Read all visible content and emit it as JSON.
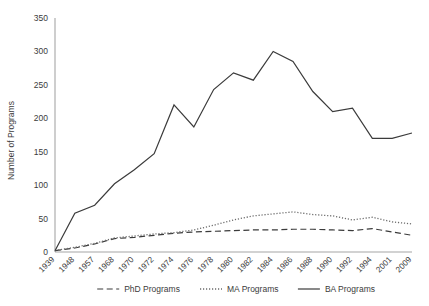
{
  "chart_data": {
    "type": "line",
    "title": "",
    "xlabel": "",
    "ylabel": "Number of Programs",
    "ylim": [
      0,
      350
    ],
    "ytick_step": 50,
    "yticks": [
      "0",
      "50",
      "100",
      "150",
      "200",
      "250",
      "300",
      "350"
    ],
    "grid": false,
    "legend_position": "bottom",
    "categories": [
      "1939",
      "1948",
      "1957",
      "1968",
      "1970",
      "1972",
      "1974",
      "1976",
      "1978",
      "1980",
      "1982",
      "1984",
      "1986",
      "1988",
      "1990",
      "1992",
      "1994",
      "2001",
      "2009"
    ],
    "series": [
      {
        "name": "PhD Programs",
        "style": "dashed",
        "color": "#3b3b3b",
        "values": [
          2,
          6,
          12,
          20,
          22,
          25,
          28,
          30,
          31,
          32,
          33,
          33,
          34,
          34,
          33,
          32,
          35,
          30,
          25
        ]
      },
      {
        "name": "MA Programs",
        "style": "dotted",
        "color": "#6b6b6b",
        "values": [
          2,
          7,
          13,
          21,
          24,
          27,
          29,
          33,
          40,
          48,
          54,
          57,
          60,
          56,
          54,
          48,
          52,
          45,
          42
        ]
      },
      {
        "name": "BA Programs",
        "style": "solid",
        "color": "#3b3b3b",
        "values": [
          2,
          58,
          70,
          102,
          123,
          147,
          220,
          187,
          243,
          268,
          257,
          300,
          285,
          240,
          210,
          215,
          170,
          170,
          178
        ]
      }
    ]
  },
  "legend": {
    "items": [
      {
        "label": "PhD Programs",
        "style": "dashed"
      },
      {
        "label": "MA Programs",
        "style": "dotted"
      },
      {
        "label": "BA Programs",
        "style": "solid"
      }
    ]
  }
}
